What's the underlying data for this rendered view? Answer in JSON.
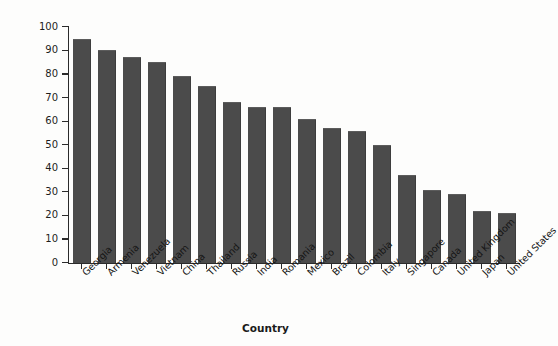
{
  "chart_data": {
    "type": "bar",
    "title": "",
    "xlabel": "Country",
    "ylabel": "Piracy rate (%)",
    "ylim": [
      0,
      100
    ],
    "yticks": [
      0,
      10,
      20,
      30,
      40,
      50,
      60,
      70,
      80,
      90,
      100
    ],
    "grid": false,
    "legend": null,
    "bar_color": "#4b4b4b",
    "background_color": "#fdfdfc",
    "axis_color": "#2b2b2b",
    "categories": [
      "Georgia",
      "Armenia",
      "Venezuela",
      "Vietnam",
      "China",
      "Thailand",
      "Russia",
      "India",
      "Romania",
      "Mexico",
      "Brazil",
      "Colombia",
      "Italy",
      "Singapore",
      "Canada",
      "United Kingdom",
      "Japan",
      "United States"
    ],
    "values": [
      95,
      90,
      87,
      85,
      79,
      75,
      68,
      66,
      66,
      61,
      57,
      56,
      50,
      37,
      31,
      29,
      22,
      21
    ]
  }
}
